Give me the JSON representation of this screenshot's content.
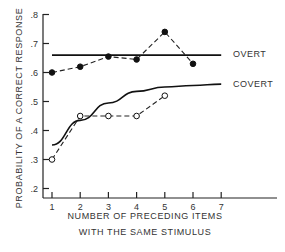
{
  "chart_data": {
    "type": "line",
    "title": "",
    "xlabel": "NUMBER OF PRECEDING ITEMS WITH THE SAME STIMULUS",
    "xlabel_lines": [
      "NUMBER OF PRECEDING ITEMS",
      "WITH THE SAME STIMULUS"
    ],
    "ylabel": "PROBABILITY OF A CORRECT RESPONSE",
    "x_ticks": [
      1,
      2,
      3,
      4,
      5,
      6,
      7
    ],
    "y_ticks": [
      ".2",
      ".3",
      ".4",
      ".5",
      ".6",
      ".7",
      ".8"
    ],
    "xlim": [
      1,
      7
    ],
    "ylim": [
      0.2,
      0.8
    ],
    "grid": false,
    "series": [
      {
        "name": "OVERT (observed)",
        "style": "dashed, filled circles",
        "x": [
          1,
          2,
          3,
          4,
          5,
          6
        ],
        "values": [
          0.6,
          0.62,
          0.655,
          0.645,
          0.74,
          0.63
        ]
      },
      {
        "name": "COVERT (observed)",
        "style": "dashed, open circles",
        "x": [
          1,
          2,
          3,
          4,
          5
        ],
        "values": [
          0.3,
          0.45,
          0.45,
          0.45,
          0.52
        ]
      },
      {
        "name": "OVERT",
        "style": "solid line (theoretical)",
        "x": [
          1,
          7
        ],
        "values": [
          0.66,
          0.66
        ]
      },
      {
        "name": "COVERT",
        "style": "solid curve (theoretical)",
        "x": [
          1,
          2,
          3,
          4,
          5,
          6,
          7
        ],
        "values": [
          0.35,
          0.435,
          0.495,
          0.535,
          0.55,
          0.555,
          0.56
        ]
      }
    ],
    "annotations": [
      "OVERT",
      "COVERT"
    ],
    "legend_position": "right, inline labels"
  }
}
